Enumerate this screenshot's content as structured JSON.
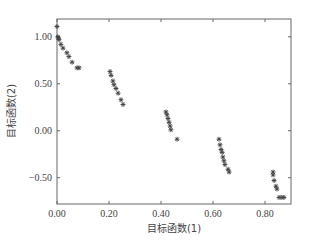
{
  "chart_data": {
    "type": "scatter",
    "title": "",
    "xlabel": "目标函数(1)",
    "ylabel": "目标函数(2)",
    "xlim": [
      0.0,
      0.9
    ],
    "ylim": [
      -0.78,
      1.19
    ],
    "xticks": [
      0.0,
      0.2,
      0.4,
      0.6,
      0.8
    ],
    "xtick_labels": [
      "0.00",
      "0.20",
      "0.40",
      "0.60",
      "0.80"
    ],
    "yticks": [
      1.0,
      0.5,
      0.0,
      -0.5
    ],
    "ytick_labels": [
      "1.00",
      "0.50",
      "0.00",
      "−0.50"
    ],
    "grid": false,
    "legend": null,
    "marker": "*",
    "marker_color": "#444444",
    "series": [
      {
        "name": "Pareto front",
        "points": [
          [
            0.0,
            1.11
          ],
          [
            0.003,
            1.0
          ],
          [
            0.005,
            0.99
          ],
          [
            0.008,
            0.97
          ],
          [
            0.015,
            0.92
          ],
          [
            0.023,
            0.88
          ],
          [
            0.038,
            0.83
          ],
          [
            0.046,
            0.79
          ],
          [
            0.058,
            0.73
          ],
          [
            0.077,
            0.67
          ],
          [
            0.085,
            0.67
          ],
          [
            0.204,
            0.63
          ],
          [
            0.208,
            0.59
          ],
          [
            0.215,
            0.53
          ],
          [
            0.219,
            0.49
          ],
          [
            0.227,
            0.45
          ],
          [
            0.235,
            0.4
          ],
          [
            0.246,
            0.33
          ],
          [
            0.254,
            0.28
          ],
          [
            0.419,
            0.2
          ],
          [
            0.423,
            0.17
          ],
          [
            0.427,
            0.13
          ],
          [
            0.431,
            0.09
          ],
          [
            0.435,
            0.05
          ],
          [
            0.438,
            0.01
          ],
          [
            0.462,
            -0.09
          ],
          [
            0.623,
            -0.09
          ],
          [
            0.627,
            -0.15
          ],
          [
            0.631,
            -0.2
          ],
          [
            0.635,
            -0.23
          ],
          [
            0.638,
            -0.28
          ],
          [
            0.642,
            -0.32
          ],
          [
            0.646,
            -0.36
          ],
          [
            0.658,
            -0.41
          ],
          [
            0.662,
            -0.44
          ],
          [
            0.831,
            -0.44
          ],
          [
            0.831,
            -0.47
          ],
          [
            0.835,
            -0.53
          ],
          [
            0.842,
            -0.59
          ],
          [
            0.846,
            -0.62
          ],
          [
            0.854,
            -0.71
          ],
          [
            0.865,
            -0.71
          ],
          [
            0.873,
            -0.71
          ]
        ]
      }
    ]
  },
  "layout": {
    "plot_left": 57,
    "plot_top": 19,
    "plot_right": 291,
    "plot_bottom": 204
  }
}
